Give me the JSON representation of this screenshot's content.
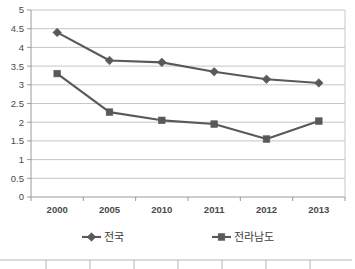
{
  "chart_data": {
    "type": "line",
    "title": "",
    "subtitle": "",
    "xlabel": "",
    "ylabel": "",
    "categories": [
      "2000",
      "2005",
      "2010",
      "2011",
      "2012",
      "2013"
    ],
    "ylim": [
      0,
      5
    ],
    "ytick_step": 0.5,
    "ytick_labels": [
      "0",
      "0.5",
      "1",
      "1.5",
      "2",
      "2.5",
      "3",
      "3.5",
      "4",
      "4.5",
      "5"
    ],
    "grid": true,
    "grid_axis": "y",
    "legend_position": "bottom",
    "series": [
      {
        "name": "전국",
        "marker": "diamond",
        "color": "#595959",
        "values": [
          4.4,
          3.65,
          3.6,
          3.35,
          3.15,
          3.05
        ]
      },
      {
        "name": "전라남도",
        "marker": "square",
        "color": "#595959",
        "values": [
          3.3,
          2.27,
          2.05,
          1.95,
          1.55,
          2.03
        ]
      }
    ]
  },
  "legend": {
    "items": [
      {
        "label": "전국",
        "marker": "diamond-marker-icon"
      },
      {
        "label": "전라남도",
        "marker": "square-marker-icon"
      }
    ]
  },
  "axes": {
    "y": {
      "labels": [
        "5",
        "4.5",
        "4",
        "3.5",
        "3",
        "2.5",
        "2",
        "1.5",
        "1",
        "0.5",
        "0"
      ]
    },
    "x": {
      "labels": [
        "2000",
        "2005",
        "2010",
        "2011",
        "2012",
        "2013"
      ]
    }
  },
  "colors": {
    "series": "#595959",
    "gridline": "#bfbfbf",
    "axis": "#9a9a9a",
    "text": "#4a4a4a",
    "background": "#ffffff"
  }
}
